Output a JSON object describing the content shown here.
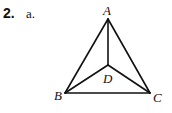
{
  "problem": {
    "number": "2.",
    "part": "a."
  },
  "diagram": {
    "points": [
      {
        "name": "A",
        "x": 108,
        "y": 19,
        "lx": 103,
        "ly": 15
      },
      {
        "name": "B",
        "x": 65,
        "y": 93,
        "lx": 54,
        "ly": 100
      },
      {
        "name": "C",
        "x": 150,
        "y": 93,
        "lx": 153,
        "ly": 102
      },
      {
        "name": "D",
        "x": 108,
        "y": 65,
        "lx": 103,
        "ly": 83
      }
    ],
    "segments": [
      [
        "A",
        "B"
      ],
      [
        "A",
        "C"
      ],
      [
        "B",
        "C"
      ],
      [
        "A",
        "D"
      ],
      [
        "B",
        "D"
      ],
      [
        "C",
        "D"
      ]
    ],
    "stroke_color": "#111111"
  }
}
